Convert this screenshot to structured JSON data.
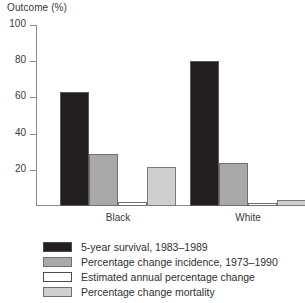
{
  "chart_data": {
    "type": "bar",
    "title": "Outcome (%)",
    "xlabel": "",
    "ylabel": "Outcome (%)",
    "ylim": [
      0,
      100
    ],
    "yticks": [
      0,
      20,
      40,
      60,
      80,
      100
    ],
    "ytick_labels": [
      "20",
      "40",
      "60",
      "80",
      "100"
    ],
    "grid": false,
    "legend_position": "bottom-left",
    "categories": [
      "Black",
      "White"
    ],
    "series": [
      {
        "name": "5-year survival, 1983–1989",
        "color": "#231f20",
        "values": [
          63,
          80
        ]
      },
      {
        "name": "Percentage change incidence, 1973–1990",
        "color": "#a9a9a9",
        "values": [
          28.5,
          23.5
        ]
      },
      {
        "name": "Estimated annual percentage change",
        "color": "#ffffff",
        "values": [
          2,
          1.5
        ]
      },
      {
        "name": "Percentage change mortality",
        "color": "#cfcfcf",
        "values": [
          21.5,
          3.5
        ]
      }
    ]
  },
  "axis": {
    "title": "Outcome (%)"
  },
  "legend": {
    "items": [
      {
        "label": "5-year survival, 1983–1989",
        "swatch": "dark-swatch"
      },
      {
        "label": "Percentage change incidence, 1973–1990",
        "swatch": "medium-gray-swatch"
      },
      {
        "label": "Estimated annual percentage change",
        "swatch": "white-swatch"
      },
      {
        "label": "Percentage change mortality",
        "swatch": "light-gray-swatch"
      }
    ]
  }
}
